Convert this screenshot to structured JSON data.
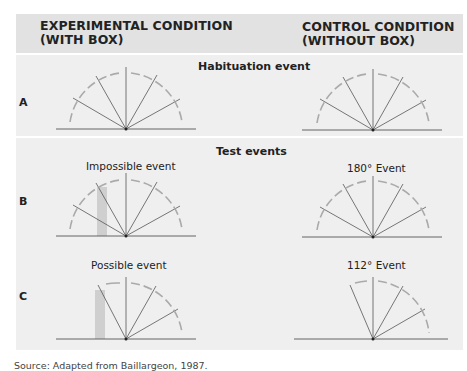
{
  "header": {
    "left_title_line1": "EXPERIMENTAL CONDITION",
    "left_title_line2": "(WITH BOX)",
    "right_title_line1": "CONTROL CONDITION",
    "right_title_line2": "(WITHOUT BOX)"
  },
  "sections": {
    "habituation": {
      "title": "Habituation event"
    },
    "test": {
      "title": "Test events"
    }
  },
  "rows": [
    {
      "label": "A",
      "left_event": "",
      "right_event": ""
    },
    {
      "label": "B",
      "left_event": "Impossible event",
      "right_event": "180° Event"
    },
    {
      "label": "C",
      "left_event": "Possible event",
      "right_event": "112° Event"
    }
  ],
  "source": "Source: Adapted from Baillargeon, 1987.",
  "colors": {
    "header_bg": "#e2e2e2",
    "panel_bg": "#efefef",
    "line": "#555555",
    "arrow": "#aaaaaa",
    "box": "#cfcfcf"
  }
}
